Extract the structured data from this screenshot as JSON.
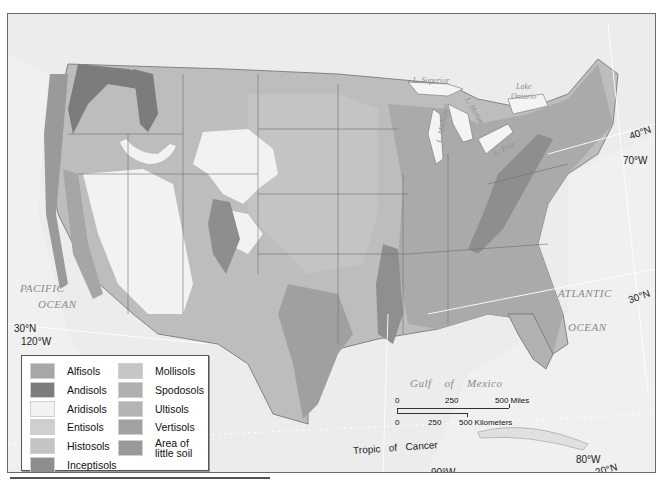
{
  "map": {
    "title": "Soil orders of the contiguous United States",
    "ocean_labels": {
      "pacific_line1": "PACIFIC",
      "pacific_line2": "OCEAN",
      "atlantic_line1": "ATLANTIC",
      "atlantic_line2": "OCEAN",
      "gulf": "Gulf    of    Mexico"
    },
    "lake_labels": {
      "superior": "L. Superior",
      "michigan": "L. Michigan",
      "huron": "L. Huron",
      "erie": "L. Erie",
      "ontario_line1": "Lake",
      "ontario_line2": "Ontario"
    },
    "coordinates": {
      "lat_30_west": "30°N",
      "lon_120": "120°W",
      "lat_40_east": "40°N",
      "lon_70": "70°W",
      "lat_30_east": "30°N",
      "lon_90": "90°W",
      "lon_80": "80°W",
      "lat_20": "20°N",
      "tropic": "Tropic   of   Cancer"
    },
    "scale": {
      "miles_0": "0",
      "miles_250": "250",
      "miles_500": "500 Miles",
      "km_0": "0",
      "km_250": "250",
      "km_500": "500 Kilometers"
    }
  },
  "legend": {
    "items": [
      {
        "label": "Alfisols",
        "color": "#a7a7a7"
      },
      {
        "label": "Andisols",
        "color": "#7c7c7c"
      },
      {
        "label": "Aridisols",
        "color": "#f2f2f2"
      },
      {
        "label": "Entisols",
        "color": "#cfcfcf"
      },
      {
        "label": "Histosols",
        "color": "#c4c4c4"
      },
      {
        "label": "Inceptisols",
        "color": "#8e8e8e"
      },
      {
        "label": "Mollisols",
        "color": "#c6c6c6"
      },
      {
        "label": "Spodosols",
        "color": "#afafaf"
      },
      {
        "label": "Ultisols",
        "color": "#b4b4b4"
      },
      {
        "label": "Vertisols",
        "color": "#a2a2a2"
      },
      {
        "label": "Area of little soil",
        "color": "#999999"
      }
    ]
  }
}
